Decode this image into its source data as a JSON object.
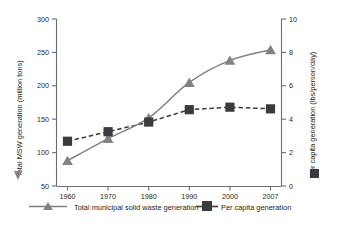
{
  "chart_data": {
    "type": "line",
    "title": "",
    "xlabel": "",
    "categories": [
      "1960",
      "1970",
      "1980",
      "1990",
      "2000",
      "2007"
    ],
    "x": [
      1960,
      1970,
      1980,
      1990,
      2000,
      2007
    ],
    "grid": false,
    "legend_position": "bottom",
    "series": [
      {
        "name": "Total municipal solid waste generation",
        "axis": "left",
        "marker": "triangle",
        "line_style": "solid",
        "color": "#808285",
        "values": [
          88,
          121,
          152,
          205,
          238,
          254
        ]
      },
      {
        "name": "Per capita generation",
        "axis": "right",
        "marker": "square",
        "line_style": "dashed",
        "color": "#3b3b3d",
        "values": [
          2.68,
          3.25,
          3.83,
          4.57,
          4.72,
          4.62
        ]
      }
    ],
    "left_axis": {
      "label": "Total MSW generation (million tons)",
      "ticks": [
        "50",
        "100",
        "150",
        "200",
        "250",
        "300"
      ],
      "tick_values": [
        50,
        100,
        150,
        200,
        250,
        300
      ],
      "ylim": [
        50,
        300
      ]
    },
    "right_axis": {
      "label": "Per capita generation (lbs/person/day)",
      "ticks": [
        "0",
        "2",
        "4",
        "6",
        "8",
        "10"
      ],
      "tick_values": [
        0,
        2,
        4,
        6,
        8,
        10
      ],
      "ylim": [
        0,
        10
      ]
    }
  },
  "legend": {
    "items": [
      {
        "label": "Total municipal solid waste generation",
        "marker": "triangle-icon",
        "color": "#808285"
      },
      {
        "label": "Per capita generation",
        "marker": "square-icon",
        "color": "#3b3b3d"
      }
    ]
  }
}
